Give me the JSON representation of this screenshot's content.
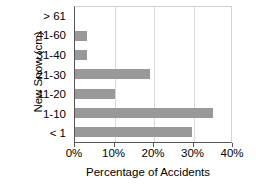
{
  "chart_data": {
    "type": "bar",
    "orientation": "horizontal",
    "title": "",
    "xlabel": "Percentage of Accidents",
    "ylabel": "New Snow (cm)",
    "categories": [
      "> 61",
      "41-60",
      "31-40",
      "21-30",
      "11-20",
      "1-10",
      "< 1"
    ],
    "values": [
      0,
      3,
      3,
      19,
      10,
      35,
      29.5
    ],
    "xlim": [
      0,
      40
    ],
    "ylim": null,
    "xticks": [
      0,
      10,
      20,
      30,
      40
    ],
    "xtick_labels": [
      "0%",
      "10%",
      "20%",
      "30%",
      "40%"
    ],
    "grid": true,
    "grid_axis": "x",
    "legend": null,
    "bar_color": "#999999",
    "axis_color": "#555555",
    "grid_color": "#d8d8d8",
    "text_color": "#000000",
    "background": "#ffffff"
  }
}
